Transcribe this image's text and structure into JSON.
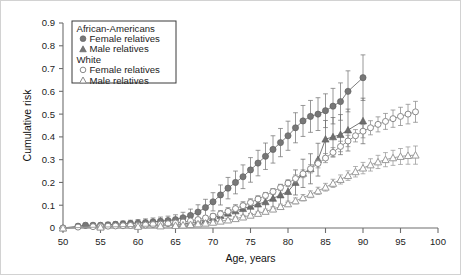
{
  "figure": {
    "background": "#ffffff",
    "border_color": "#d2d2d2"
  },
  "axes": {
    "x_title": "Age, years",
    "y_title": "Cumulative risk",
    "x_ticks": [
      "50",
      "55",
      "60",
      "65",
      "70",
      "75",
      "80",
      "85",
      "90",
      "95",
      "100"
    ],
    "y_ticks": [
      "0",
      "0.1",
      "0.2",
      "0.3",
      "0.4",
      "0.5",
      "0.6",
      "0.7",
      "0.8",
      "0.9"
    ]
  },
  "legend": {
    "groups": [
      {
        "header": "African-Americans",
        "entries": [
          {
            "label": "Female relatives",
            "marker": "filled-circle-icon",
            "color": "#777777"
          },
          {
            "label": "Male relatives",
            "marker": "filled-triangle-icon",
            "color": "#777777"
          }
        ]
      },
      {
        "header": "White",
        "entries": [
          {
            "label": "Female relatives",
            "marker": "hollow-circle-icon",
            "color": "#8a8a8a"
          },
          {
            "label": "Male relatives",
            "marker": "hollow-triangle-icon",
            "color": "#8a8a8a"
          }
        ]
      }
    ]
  },
  "chart_data": {
    "type": "line",
    "title": "",
    "xlabel": "Age, years",
    "ylabel": "Cumulative risk",
    "xlim": [
      50,
      100
    ],
    "ylim": [
      0,
      0.9
    ],
    "grid": false,
    "legend_position": "top-left",
    "error_bars": true,
    "series": [
      {
        "name": "African-Americans Female relatives",
        "marker": "filled-circle",
        "color": "#777777",
        "x": [
          50,
          52,
          53,
          54,
          55,
          56,
          57,
          58,
          59,
          60,
          61,
          62,
          63,
          64,
          65,
          66,
          67,
          68,
          69,
          70,
          71,
          72,
          73,
          74,
          75,
          76,
          77,
          78,
          79,
          80,
          81,
          82,
          83,
          84,
          85,
          86,
          87,
          88,
          90
        ],
        "y": [
          0.0,
          0.008,
          0.012,
          0.012,
          0.012,
          0.014,
          0.016,
          0.018,
          0.02,
          0.022,
          0.024,
          0.027,
          0.03,
          0.033,
          0.037,
          0.045,
          0.055,
          0.07,
          0.09,
          0.115,
          0.145,
          0.175,
          0.2,
          0.225,
          0.255,
          0.285,
          0.315,
          0.345,
          0.375,
          0.405,
          0.44,
          0.47,
          0.49,
          0.5,
          0.515,
          0.535,
          0.555,
          0.6,
          0.66
        ],
        "yerr": [
          0.0,
          0.008,
          0.01,
          0.01,
          0.01,
          0.011,
          0.012,
          0.013,
          0.014,
          0.015,
          0.016,
          0.017,
          0.018,
          0.019,
          0.021,
          0.024,
          0.028,
          0.032,
          0.036,
          0.04,
          0.044,
          0.047,
          0.05,
          0.052,
          0.054,
          0.056,
          0.058,
          0.06,
          0.062,
          0.064,
          0.066,
          0.068,
          0.07,
          0.072,
          0.074,
          0.078,
          0.082,
          0.09,
          0.1
        ]
      },
      {
        "name": "African-Americans Male relatives",
        "marker": "filled-triangle",
        "color": "#6e6e6e",
        "x": [
          50,
          55,
          60,
          63,
          65,
          66,
          67,
          68,
          69,
          70,
          71,
          72,
          73,
          74,
          75,
          76,
          77,
          78,
          79,
          80,
          81,
          82,
          83,
          84,
          85,
          86,
          87,
          88,
          90
        ],
        "y": [
          0.0,
          0.005,
          0.01,
          0.012,
          0.015,
          0.018,
          0.022,
          0.028,
          0.035,
          0.045,
          0.055,
          0.065,
          0.075,
          0.085,
          0.095,
          0.105,
          0.115,
          0.13,
          0.145,
          0.16,
          0.2,
          0.24,
          0.26,
          0.3,
          0.39,
          0.4,
          0.41,
          0.43,
          0.47
        ],
        "yerr": [
          0.0,
          0.004,
          0.006,
          0.007,
          0.008,
          0.009,
          0.011,
          0.013,
          0.015,
          0.018,
          0.021,
          0.024,
          0.027,
          0.03,
          0.033,
          0.036,
          0.039,
          0.042,
          0.045,
          0.048,
          0.055,
          0.062,
          0.066,
          0.072,
          0.082,
          0.085,
          0.088,
          0.092,
          0.1
        ]
      },
      {
        "name": "White Female relatives",
        "marker": "hollow-circle",
        "color": "#8a8a8a",
        "x": [
          50,
          52,
          54,
          55,
          56,
          57,
          58,
          59,
          60,
          61,
          62,
          63,
          64,
          65,
          66,
          67,
          68,
          69,
          70,
          71,
          72,
          73,
          74,
          75,
          76,
          77,
          78,
          79,
          80,
          81,
          82,
          83,
          84,
          85,
          86,
          87,
          88,
          89,
          90,
          91,
          92,
          93,
          94,
          95,
          96,
          97
        ],
        "y": [
          0.0,
          0.004,
          0.006,
          0.007,
          0.008,
          0.009,
          0.01,
          0.011,
          0.012,
          0.013,
          0.015,
          0.017,
          0.019,
          0.022,
          0.026,
          0.031,
          0.037,
          0.044,
          0.052,
          0.062,
          0.073,
          0.085,
          0.098,
          0.112,
          0.127,
          0.143,
          0.16,
          0.178,
          0.197,
          0.217,
          0.238,
          0.26,
          0.283,
          0.307,
          0.332,
          0.358,
          0.382,
          0.405,
          0.425,
          0.44,
          0.455,
          0.468,
          0.48,
          0.49,
          0.5,
          0.51
        ],
        "yerr": [
          0.0,
          0.002,
          0.002,
          0.002,
          0.003,
          0.003,
          0.003,
          0.003,
          0.004,
          0.004,
          0.004,
          0.004,
          0.005,
          0.005,
          0.006,
          0.006,
          0.007,
          0.007,
          0.008,
          0.009,
          0.009,
          0.01,
          0.011,
          0.011,
          0.012,
          0.013,
          0.013,
          0.014,
          0.015,
          0.016,
          0.017,
          0.018,
          0.019,
          0.02,
          0.021,
          0.023,
          0.025,
          0.027,
          0.029,
          0.031,
          0.033,
          0.035,
          0.038,
          0.04,
          0.043,
          0.046
        ]
      },
      {
        "name": "White Male relatives",
        "marker": "hollow-triangle",
        "color": "#9a9a9a",
        "x": [
          50,
          55,
          60,
          63,
          65,
          66,
          67,
          68,
          69,
          70,
          71,
          72,
          73,
          74,
          75,
          76,
          77,
          78,
          79,
          80,
          81,
          82,
          83,
          84,
          85,
          86,
          87,
          88,
          89,
          90,
          91,
          92,
          93,
          94,
          95,
          96,
          97
        ],
        "y": [
          0.0,
          0.004,
          0.007,
          0.009,
          0.011,
          0.013,
          0.015,
          0.018,
          0.021,
          0.025,
          0.03,
          0.035,
          0.041,
          0.048,
          0.056,
          0.064,
          0.073,
          0.083,
          0.094,
          0.106,
          0.119,
          0.133,
          0.148,
          0.163,
          0.179,
          0.196,
          0.213,
          0.23,
          0.247,
          0.263,
          0.277,
          0.29,
          0.3,
          0.308,
          0.314,
          0.318,
          0.32
        ],
        "yerr": [
          0.0,
          0.002,
          0.003,
          0.003,
          0.003,
          0.004,
          0.004,
          0.004,
          0.005,
          0.005,
          0.006,
          0.006,
          0.007,
          0.008,
          0.008,
          0.009,
          0.01,
          0.011,
          0.011,
          0.012,
          0.013,
          0.014,
          0.015,
          0.016,
          0.017,
          0.018,
          0.02,
          0.021,
          0.023,
          0.025,
          0.027,
          0.029,
          0.031,
          0.033,
          0.035,
          0.038,
          0.04
        ]
      }
    ]
  }
}
